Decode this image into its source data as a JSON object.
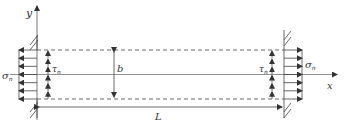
{
  "diagram": {
    "axes": {
      "y_label": "y",
      "x_label": "x"
    },
    "dimensions": {
      "width_label": "b",
      "length_label": "L"
    },
    "left_end": {
      "normal_stress_symbol": "σ",
      "normal_stress_subscript": "n",
      "shear_stress_symbol": "τ",
      "shear_stress_subscript": "n",
      "normal_arrow_count": 7,
      "shear_arrow_count": 6,
      "normal_direction": "left",
      "shear_direction": "up"
    },
    "right_end": {
      "normal_stress_symbol": "σ",
      "normal_stress_subscript": "n",
      "shear_stress_symbol": "τ",
      "shear_stress_subscript": "n",
      "normal_arrow_count": 7,
      "shear_arrow_count": 6,
      "normal_direction": "right",
      "shear_direction": "up"
    },
    "colors": {
      "line": "#333333"
    }
  }
}
